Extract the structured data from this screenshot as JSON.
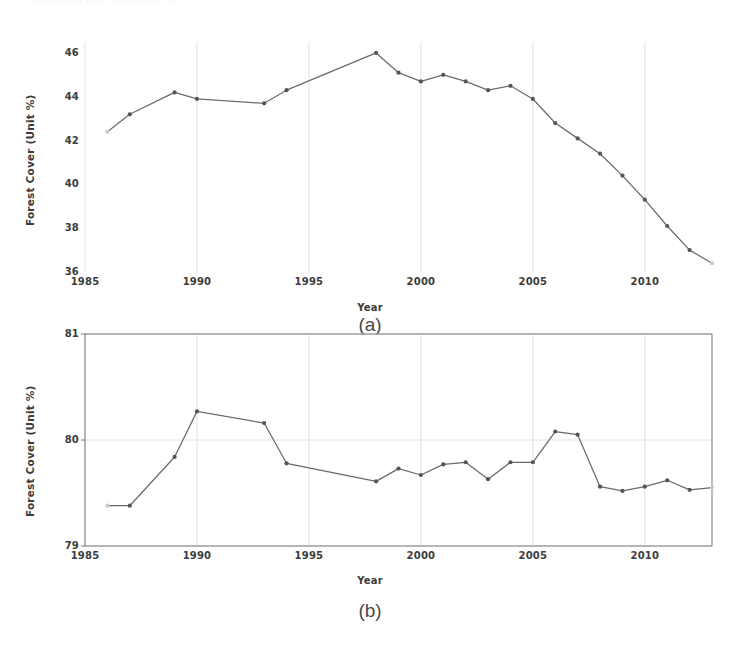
{
  "page": {
    "top_bleed_text": "...........   ..  ......  ............. ...",
    "background": "#ffffff",
    "line_color": "#6b6b6b",
    "marker_color": "#555555",
    "grid_color": "#e2e2e2",
    "axis_color": "#7a7a7a"
  },
  "figure_a": {
    "caption": "(a)",
    "ylabel": "Forest Cover (Unit %)",
    "xlabel": "Year",
    "ytick_labels": [
      "46",
      "44",
      "42",
      "40",
      "38",
      "36"
    ],
    "xtick_labels": [
      "1985",
      "1990",
      "1995",
      "2000",
      "2005",
      "2010"
    ]
  },
  "figure_b": {
    "caption": "(b)",
    "ylabel": "Forest Cover (Unit %)",
    "xlabel": "Year",
    "ytick_labels": [
      "81",
      "80",
      "79"
    ],
    "xtick_labels": [
      "1985",
      "1990",
      "1995",
      "2000",
      "2005",
      "2010"
    ]
  },
  "chart_data": [
    {
      "id": "a",
      "type": "line",
      "title": "(a)",
      "xlabel": "Year",
      "ylabel": "Forest Cover (Unit %)",
      "xlim": [
        1985,
        2013
      ],
      "ylim": [
        36,
        46.5
      ],
      "xticks": [
        1985,
        1990,
        1995,
        2000,
        2005,
        2010
      ],
      "yticks": [
        36,
        38,
        40,
        42,
        44,
        46
      ],
      "grid": "vertical-faint",
      "legend": "none",
      "markers": true,
      "x": [
        1986,
        1987,
        1989,
        1990,
        1993,
        1994,
        1998,
        1999,
        2000,
        2001,
        2002,
        2003,
        2004,
        2005,
        2006,
        2007,
        2008,
        2009,
        2010,
        2011,
        2012,
        2013
      ],
      "y": [
        42.4,
        43.2,
        44.2,
        43.9,
        43.7,
        44.3,
        46.0,
        45.1,
        44.7,
        45.0,
        44.7,
        44.3,
        44.5,
        43.9,
        42.8,
        42.1,
        41.4,
        40.4,
        39.3,
        38.1,
        37.0,
        36.4
      ]
    },
    {
      "id": "b",
      "type": "line",
      "title": "(b)",
      "xlabel": "Year",
      "ylabel": "Forest Cover (Unit %)",
      "xlim": [
        1985,
        2013
      ],
      "ylim": [
        79,
        81
      ],
      "xticks": [
        1985,
        1990,
        1995,
        2000,
        2005,
        2010
      ],
      "yticks": [
        79,
        80,
        81
      ],
      "grid": "vertical-faint",
      "legend": "none",
      "markers": true,
      "frame": true,
      "x": [
        1986,
        1987,
        1989,
        1990,
        1993,
        1994,
        1998,
        1999,
        2000,
        2001,
        2002,
        2003,
        2004,
        2005,
        2006,
        2007,
        2008,
        2009,
        2010,
        2011,
        2012,
        2013
      ],
      "y": [
        79.38,
        79.38,
        79.84,
        80.27,
        80.16,
        79.78,
        79.61,
        79.73,
        79.67,
        79.77,
        79.79,
        79.63,
        79.79,
        79.79,
        80.08,
        80.05,
        79.56,
        79.52,
        79.56,
        79.62,
        79.53,
        79.55
      ]
    }
  ]
}
